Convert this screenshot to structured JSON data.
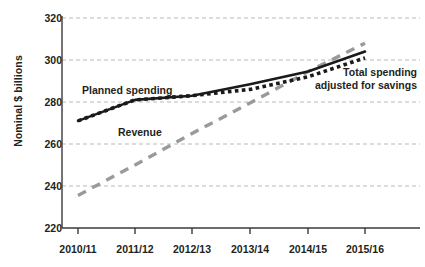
{
  "chart_data": {
    "type": "line",
    "title": "",
    "subtitle": "",
    "xlabel": "",
    "ylabel": "Nominal $ billions",
    "categories": [
      "2010/11",
      "2011/12",
      "2012/13",
      "2013/14",
      "2014/15",
      "2015/16"
    ],
    "ylim": [
      220,
      320
    ],
    "yticks": [
      220,
      240,
      260,
      280,
      300,
      320
    ],
    "grid": "horizontal dashed gridlines only",
    "legend": "inline annotations next to each series",
    "series": [
      {
        "name": "Planned spending",
        "style": "solid",
        "color": "#1a1a1a",
        "values": [
          271,
          281,
          283,
          288.5,
          294.5,
          304
        ]
      },
      {
        "name": "Total spending adjusted for savings",
        "style": "dotted",
        "color": "#1a1a1a",
        "values": [
          271,
          281,
          283,
          286,
          292,
          301
        ]
      },
      {
        "name": "Revenue",
        "style": "dashed",
        "color": "#9a9a9a",
        "values": [
          235.5,
          250,
          265,
          279.5,
          294.5,
          308
        ]
      }
    ],
    "annotations": [
      {
        "text": "Planned spending",
        "series": "Planned spending"
      },
      {
        "text": "Revenue",
        "series": "Revenue"
      },
      {
        "text": "Total spending",
        "series": "Total spending adjusted for savings"
      },
      {
        "text": "adjusted for savings",
        "series": "Total spending adjusted for savings"
      }
    ]
  },
  "axis": {
    "y_title": "Nominal $ billions",
    "y_ticks": [
      "320",
      "300",
      "280",
      "260",
      "240",
      "220"
    ],
    "x_ticks": [
      "2010/11",
      "2011/12",
      "2012/13",
      "2013/14",
      "2014/15",
      "2015/16"
    ]
  },
  "annotations": {
    "planned_spending": "Planned spending",
    "revenue": "Revenue",
    "total_spending_line1": "Total spending",
    "total_spending_line2": "adjusted for savings"
  },
  "colors": {
    "planned": "#1a1a1a",
    "adjusted": "#1a1a1a",
    "revenue": "#9a9a9a",
    "grid": "#b9b9b9",
    "axis": "#3a3a3a",
    "text": "#231f20"
  }
}
